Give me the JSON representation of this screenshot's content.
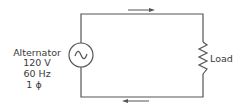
{
  "diagram": {
    "type": "single-phase AC circuit",
    "source": {
      "name": "Alternator",
      "voltage": "120 V",
      "frequency": "60 Hz",
      "phase": "1 ϕ",
      "symbol": "ac-source-sine-icon"
    },
    "load": {
      "label": "Load",
      "symbol": "resistor-zigzag-icon"
    },
    "current_direction": {
      "top_wire": "right",
      "bottom_wire": "left"
    },
    "colors": {
      "line": "#555555",
      "text": "#3a3a3a",
      "background": "#ffffff"
    }
  }
}
